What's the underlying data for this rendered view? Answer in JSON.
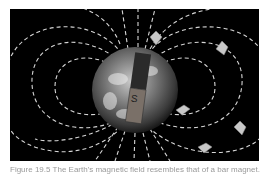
{
  "figure": {
    "magnet_label": "S",
    "colors": {
      "background": "#000000",
      "field_lines": "#d0d0d0",
      "magnet": "#7a7068",
      "needle": "#c8c8c8"
    }
  },
  "caption": {
    "text": "Figure 19.5 The Earth's magnetic field resembles that of a bar magnet."
  }
}
